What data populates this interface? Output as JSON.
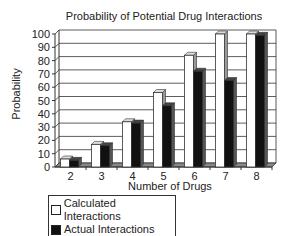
{
  "chart_data": {
    "type": "bar",
    "title": "Probability of Potential Drug Interactions",
    "xlabel": "Number of Drugs",
    "ylabel": "Probability",
    "ylim": [
      0,
      100
    ],
    "yticks": [
      0,
      10,
      20,
      30,
      40,
      50,
      60,
      70,
      80,
      90,
      100
    ],
    "grid": true,
    "legend_position": "bottom-left",
    "categories": [
      "2",
      "3",
      "4",
      "5",
      "6",
      "7",
      "8"
    ],
    "series": [
      {
        "name": "Calculated Interactions",
        "color": "#ffffff",
        "values": [
          6,
          17,
          34,
          56,
          84,
          100,
          100
        ]
      },
      {
        "name": "Actual Interactions",
        "color": "#111111",
        "values": [
          5,
          16,
          33,
          46,
          72,
          65,
          99
        ]
      }
    ]
  },
  "legend": {
    "items": [
      "Calculated Interactions",
      "Actual Interactions"
    ]
  }
}
